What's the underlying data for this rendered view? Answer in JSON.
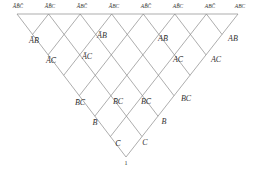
{
  "diagram": {
    "type": "boolean-lattice-triangle",
    "line_color": "#8a8a8a",
    "text_color": "#333333",
    "geometry": {
      "apex": [
        126,
        157
      ],
      "top_left": [
        17,
        14
      ],
      "top_right": [
        238,
        14
      ],
      "divisions": 7
    },
    "top_row": [
      {
        "label": "ĀB̄C̄",
        "x": 18,
        "y": 7
      },
      {
        "label": "ĀB̄C",
        "x": 50,
        "y": 7
      },
      {
        "label": "ĀBC̄",
        "x": 82,
        "y": 7
      },
      {
        "label": "ĀBC",
        "x": 114,
        "y": 7
      },
      {
        "label": "AB̄C̄",
        "x": 146,
        "y": 7
      },
      {
        "label": "AB̄C",
        "x": 178,
        "y": 7
      },
      {
        "label": "ABC̄",
        "x": 210,
        "y": 7
      },
      {
        "label": "ABC",
        "x": 240,
        "y": 7
      }
    ],
    "pair_ab": [
      {
        "label": "ĀB̄",
        "x": 34,
        "y": 41
      },
      {
        "label": "ĀB",
        "x": 102,
        "y": 36
      },
      {
        "label": "AB̄",
        "x": 163,
        "y": 39
      },
      {
        "label": "AB",
        "x": 233,
        "y": 39
      }
    ],
    "pair_ac": [
      {
        "label": "ĀC̄",
        "x": 51,
        "y": 61
      },
      {
        "label": "ĀC",
        "x": 87,
        "y": 57
      },
      {
        "label": "AC̄",
        "x": 178,
        "y": 60
      },
      {
        "label": "AC",
        "x": 216,
        "y": 60
      }
    ],
    "pair_bc": [
      {
        "label": "B̄C̄",
        "x": 80,
        "y": 103
      },
      {
        "label": "B̄C",
        "x": 118,
        "y": 102
      },
      {
        "label": "BC̄",
        "x": 146,
        "y": 102
      },
      {
        "label": "BC",
        "x": 186,
        "y": 99
      }
    ],
    "singles": [
      {
        "label": "B̄",
        "x": 95,
        "y": 123
      },
      {
        "label": "B",
        "x": 164,
        "y": 122
      },
      {
        "label": "C̄",
        "x": 118,
        "y": 144
      },
      {
        "label": "C",
        "x": 145,
        "y": 143
      }
    ],
    "bottom": {
      "label": "1",
      "x": 126,
      "y": 163
    }
  }
}
